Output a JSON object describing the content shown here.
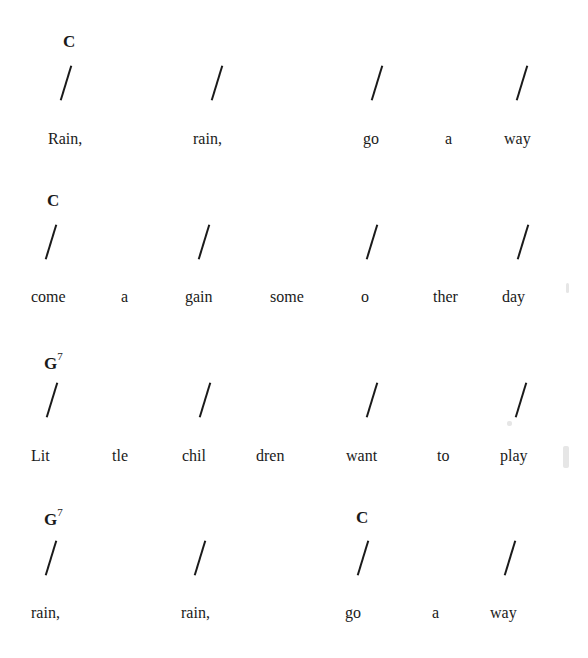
{
  "song": {
    "lines": [
      {
        "chords": [
          {
            "name": "C",
            "sup": "",
            "x": 63,
            "y": 32
          }
        ],
        "slashes": [
          65,
          216,
          376,
          521
        ],
        "slash_y": 65,
        "lyrics_y": 130,
        "lyrics": [
          {
            "text": "Rain,",
            "x": 48
          },
          {
            "text": "rain,",
            "x": 193
          },
          {
            "text": "go",
            "x": 363
          },
          {
            "text": "a",
            "x": 445
          },
          {
            "text": "way",
            "x": 504
          }
        ]
      },
      {
        "chords": [
          {
            "name": "C",
            "sup": "",
            "x": 47,
            "y": 191
          }
        ],
        "slashes": [
          50,
          203,
          371,
          522
        ],
        "slash_y": 224,
        "lyrics_y": 288,
        "lyrics": [
          {
            "text": "come",
            "x": 31
          },
          {
            "text": "a",
            "x": 121
          },
          {
            "text": "gain",
            "x": 185
          },
          {
            "text": "some",
            "x": 270
          },
          {
            "text": "o",
            "x": 361
          },
          {
            "text": "ther",
            "x": 433
          },
          {
            "text": "day",
            "x": 502
          }
        ]
      },
      {
        "chords": [
          {
            "name": "G",
            "sup": "7",
            "x": 44,
            "y": 352
          }
        ],
        "slashes": [
          51,
          204,
          371,
          520
        ],
        "slash_y": 382,
        "lyrics_y": 447,
        "lyrics": [
          {
            "text": "Lit",
            "x": 31
          },
          {
            "text": "tle",
            "x": 112
          },
          {
            "text": "chil",
            "x": 182
          },
          {
            "text": "dren",
            "x": 256
          },
          {
            "text": "want",
            "x": 346
          },
          {
            "text": "to",
            "x": 437
          },
          {
            "text": "play",
            "x": 500
          }
        ]
      },
      {
        "chords": [
          {
            "name": "G",
            "sup": "7",
            "x": 44,
            "y": 508
          },
          {
            "name": "C",
            "sup": "",
            "x": 356,
            "y": 508
          }
        ],
        "slashes": [
          50,
          199,
          362,
          509
        ],
        "slash_y": 540,
        "lyrics_y": 604,
        "lyrics": [
          {
            "text": "rain,",
            "x": 31
          },
          {
            "text": "rain,",
            "x": 181
          },
          {
            "text": "go",
            "x": 345
          },
          {
            "text": "a",
            "x": 432
          },
          {
            "text": "way",
            "x": 490
          }
        ]
      }
    ]
  }
}
